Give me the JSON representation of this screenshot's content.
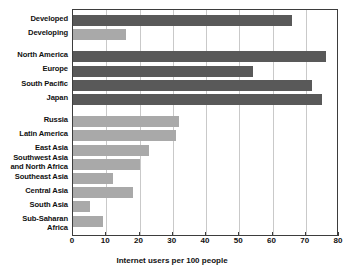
{
  "chart_data": {
    "type": "bar",
    "orientation": "horizontal",
    "title": "",
    "xlabel": "Internet users per 100 people",
    "ylabel": "",
    "xlim": [
      0,
      80
    ],
    "xticks": [
      0,
      10,
      20,
      30,
      40,
      50,
      60,
      70,
      80
    ],
    "grid": "vertical",
    "legend": "none",
    "categories": [
      "Developed",
      "Developing",
      "North America",
      "Europe",
      "South Pacific",
      "Japan",
      "Russia",
      "Latin America",
      "East Asia",
      "Southwest Asia\nand North Africa",
      "Southeast Asia",
      "Central Asia",
      "South Asia",
      "Sub-Saharan Africa"
    ],
    "values": [
      66,
      16,
      76,
      54,
      72,
      75,
      32,
      31,
      23,
      20,
      12,
      18,
      5,
      9
    ],
    "bar_shades": [
      "dark",
      "light",
      "dark",
      "dark",
      "dark",
      "dark",
      "light",
      "light",
      "light",
      "light",
      "light",
      "light",
      "light",
      "light"
    ],
    "groups": [
      {
        "name": "development-status",
        "start": 0,
        "count": 2
      },
      {
        "name": "high-income-regions",
        "start": 2,
        "count": 4
      },
      {
        "name": "other-regions",
        "start": 6,
        "count": 8
      }
    ]
  },
  "colors": {
    "bar_dark": "#595959",
    "bar_light": "#a9a9a9",
    "gridline": "#c9c9c9",
    "axis": "#3d3d3d",
    "text": "#111111",
    "background": "#ffffff"
  }
}
